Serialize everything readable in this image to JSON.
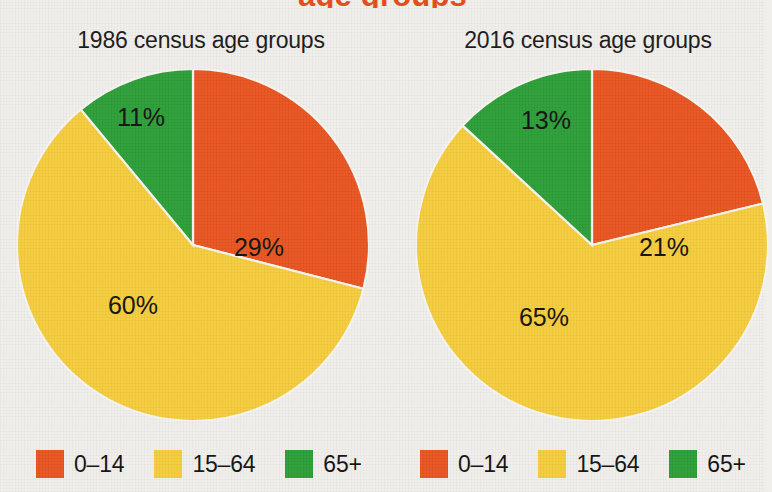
{
  "page": {
    "partial_title": "age groups",
    "background_color": "#f1efeb"
  },
  "palette": {
    "orange": "#e8541f",
    "yellow": "#f5cc3c",
    "green": "#2c9e37",
    "label_text": "#121212",
    "slice_divider": "#f7f5f1"
  },
  "legend_common": {
    "items": [
      {
        "label": "0–14",
        "color": "#e8541f",
        "swatch_name": "legend-swatch-0-14"
      },
      {
        "label": "15–64",
        "color": "#f5cc3c",
        "swatch_name": "legend-swatch-15-64"
      },
      {
        "label": "65+",
        "color": "#2c9e37",
        "swatch_name": "legend-swatch-65-plus"
      }
    ]
  },
  "charts": {
    "left": {
      "title": "1986 census age groups",
      "labels": {
        "orange": "29%",
        "yellow": "60%",
        "green": "11%"
      }
    },
    "right": {
      "title": "2016 census age groups",
      "labels": {
        "orange": "21%",
        "yellow": "65%",
        "green": "13%"
      }
    }
  },
  "chart_data": [
    {
      "type": "pie",
      "title": "1986 census age groups",
      "categories": [
        "0–14",
        "15–64",
        "65+"
      ],
      "values": [
        29,
        60,
        11
      ],
      "value_labels": [
        "29%",
        "60%",
        "11%"
      ],
      "colors": [
        "#e8541f",
        "#f5cc3c",
        "#2c9e37"
      ],
      "units": "percent",
      "total": 100,
      "start_angle_deg": 0,
      "direction": "clockwise",
      "legend": "bottom",
      "grid": false,
      "xlabel": "",
      "ylabel": ""
    },
    {
      "type": "pie",
      "title": "2016 census age groups",
      "categories": [
        "0–14",
        "15–64",
        "65+"
      ],
      "values": [
        21,
        65,
        13
      ],
      "value_labels": [
        "21%",
        "65%",
        "13%"
      ],
      "colors": [
        "#e8541f",
        "#f5cc3c",
        "#2c9e37"
      ],
      "units": "percent",
      "total": 99,
      "start_angle_deg": 0,
      "direction": "clockwise",
      "legend": "bottom",
      "grid": false,
      "xlabel": "",
      "ylabel": ""
    }
  ]
}
